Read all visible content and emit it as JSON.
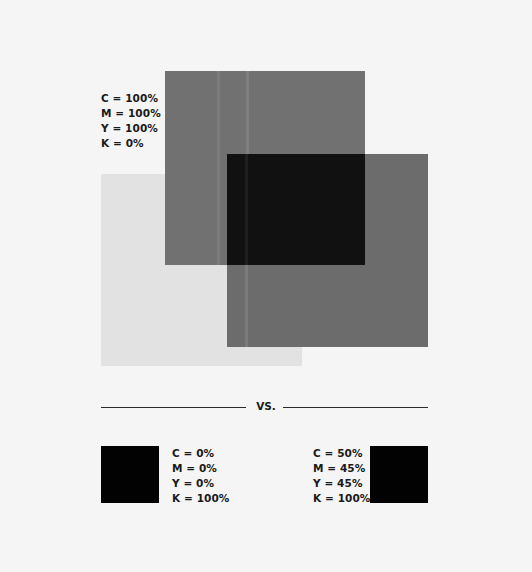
{
  "diagram": {
    "overlap_demo": {
      "squares": [
        {
          "name": "light-gray",
          "color": "#e2e2e2"
        },
        {
          "name": "mid-gray-top",
          "color": "#717171"
        },
        {
          "name": "mid-gray-right",
          "color": "#6c6c6c"
        },
        {
          "name": "overlap-dark",
          "color": "#111111"
        }
      ],
      "label": {
        "c": "C = 100%",
        "m": "M = 100%",
        "y": "Y = 100%",
        "k": "K = 0%"
      }
    },
    "divider": {
      "text": "VS."
    },
    "comparison": {
      "left": {
        "swatch_color": "#020202",
        "c": "C = 0%",
        "m": "M = 0%",
        "y": "Y = 0%",
        "k": "K = 100%"
      },
      "right": {
        "swatch_color": "#020202",
        "c": "C = 50%",
        "m": "M = 45%",
        "y": "Y = 45%",
        "k": "K = 100%"
      }
    }
  }
}
